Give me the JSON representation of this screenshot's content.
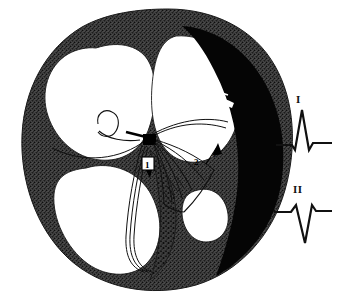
{
  "figure": {
    "background_color": "#ffffff",
    "ink_color": "#111111",
    "myocardium_color": "#3a3a3a",
    "infarct_color": "#000000",
    "chamber_color": "#ffffff"
  },
  "anatomy": {
    "myocardium_label": "myocardium-wall",
    "infarct_label": "infarct-scar-region",
    "av_node_label": "av-node-marker",
    "septum_label": "interventricular-septum",
    "chambers": [
      {
        "name": "left-atrium-chamber"
      },
      {
        "name": "right-atrium-chamber"
      },
      {
        "name": "left-ventricle-chamber"
      },
      {
        "name": "right-ventricle-chamber"
      }
    ],
    "conduction": {
      "fan_label": "purkinje-fiber-fan",
      "bundle_label": "bundle-branch-fibers",
      "apex_fibers_label": "apical-conduction-fibers"
    }
  },
  "callouts": [
    {
      "id": "1",
      "label": "1",
      "name": "callout-1"
    },
    {
      "id": "2",
      "label": "2",
      "name": "callout-2"
    },
    {
      "id": "3",
      "label": "3",
      "name": "callout-3"
    }
  ],
  "ecg": {
    "leads": [
      {
        "name": "lead-I",
        "label": "I",
        "morphology": "upright R wave with small q and s",
        "deflection": "positive"
      },
      {
        "name": "lead-II",
        "label": "II",
        "morphology": "deep negative QS complex",
        "deflection": "negative"
      }
    ]
  }
}
